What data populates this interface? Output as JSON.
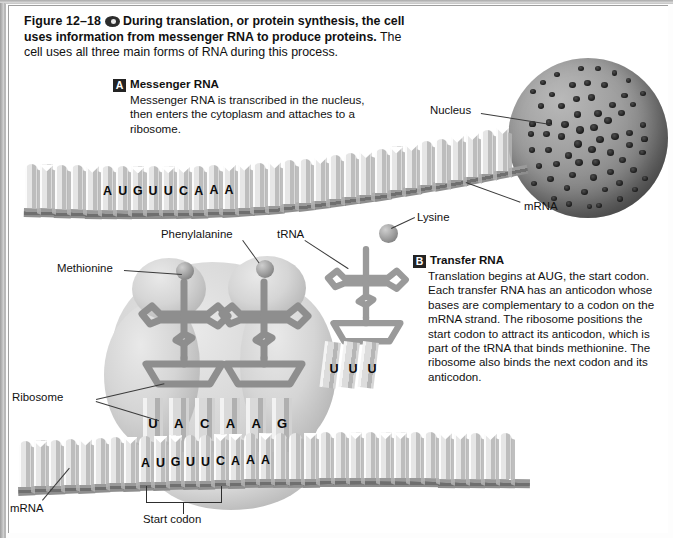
{
  "figure": {
    "number": "Figure 12–18",
    "media_icon": "cd-disc-icon",
    "lead_sentence": "During translation, or protein synthesis, the cell uses information from messenger RNA to produce proteins.",
    "rest_sentence": "The cell uses all three main forms of RNA during this process."
  },
  "sections": [
    {
      "badge": "A",
      "title": "Messenger RNA",
      "body": "Messenger RNA is transcribed in the nucleus, then enters the cytoplasm and attaches to a ribosome."
    },
    {
      "badge": "B",
      "title": "Transfer RNA",
      "body": "Translation begins at AUG, the start codon. Each transfer RNA has an anticodon whose bases are complementary to a codon on the mRNA strand. The ribosome positions the start codon to attract its anticodon, which is part of the tRNA that binds methionine. The ribosome also binds the next codon and its anticodon."
    }
  ],
  "labels": {
    "nucleus": "Nucleus",
    "mrna_top": "mRNA",
    "mrna_bottom": "mRNA",
    "methionine": "Methionine",
    "phenylalanine": "Phenylalanine",
    "lysine": "Lysine",
    "trna": "tRNA",
    "ribosome": "Ribosome",
    "start_codon": "Start codon"
  },
  "strands": {
    "top_mrna": {
      "name": "mRNA strand leaving nucleus",
      "labeled_bases": [
        "A",
        "U",
        "G",
        "U",
        "U",
        "C",
        "A",
        "A",
        "A"
      ],
      "total_bases": 30
    },
    "bottom_mrna": {
      "name": "mRNA strand in ribosome",
      "labeled_bases": [
        "A",
        "U",
        "G",
        "U",
        "U",
        "C",
        "A",
        "A",
        "A"
      ],
      "total_bases": 30
    },
    "anticodon_row": {
      "name": "tRNA anticodons bound in ribosome",
      "bases": [
        "U",
        "A",
        "C",
        "A",
        "A",
        "G"
      ]
    },
    "free_trna": {
      "name": "incoming tRNA anticodon",
      "bases": [
        "U",
        "U",
        "U"
      ]
    }
  },
  "colors": {
    "badge_bg": "#232323",
    "badge_text": "#ffffff",
    "text": "#111111",
    "leader_line": "#3b3b3b",
    "base_light": "#e6e6e6",
    "ribbon": "#6f6f6f",
    "nucleus": "#9d9d9d",
    "ribosome": "#d5d5d5"
  }
}
